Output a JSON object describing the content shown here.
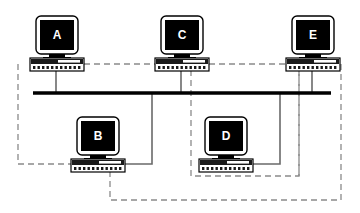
{
  "diagram": {
    "type": "network-topology",
    "canvas": {
      "width": 360,
      "height": 213
    },
    "colors": {
      "background": "#ffffff",
      "bus_line": "#000000",
      "solid_link": "#5a5a5a",
      "dashed_link": "#8a8a8a",
      "monitor_screen": "#000000",
      "monitor_bezel": "#ffffff",
      "monitor_outline": "#000000",
      "base_body": "#ffffff",
      "base_top_strip": "#1a1a1a",
      "label_text": "#ffffff"
    },
    "bus": {
      "name": "main-bus-cable",
      "x1": 33,
      "x2": 331,
      "y": 93,
      "thickness": 3.5
    },
    "nodes": [
      {
        "id": "A",
        "label": "A",
        "row": "top",
        "monitor": {
          "x": 36,
          "y": 16,
          "w": 42,
          "h": 38
        },
        "base": {
          "x": 30,
          "y": 57,
          "w": 54,
          "h": 13
        },
        "drop_x": 56,
        "drop_to_bus": true
      },
      {
        "id": "C",
        "label": "C",
        "row": "top",
        "monitor": {
          "x": 161,
          "y": 16,
          "w": 42,
          "h": 38
        },
        "base": {
          "x": 155,
          "y": 57,
          "w": 54,
          "h": 13
        },
        "drop_x": 181,
        "drop_to_bus": true
      },
      {
        "id": "E",
        "label": "E",
        "row": "top",
        "monitor": {
          "x": 292,
          "y": 16,
          "w": 42,
          "h": 38
        },
        "base": {
          "x": 286,
          "y": 57,
          "w": 54,
          "h": 13
        },
        "drop_x": 312,
        "drop_to_bus": true
      },
      {
        "id": "B",
        "label": "B",
        "row": "bottom",
        "monitor": {
          "x": 77,
          "y": 117,
          "w": 42,
          "h": 38
        },
        "base": {
          "x": 71,
          "y": 158,
          "w": 54,
          "h": 13
        },
        "drop_x": 97,
        "drop_to_bus": false
      },
      {
        "id": "D",
        "label": "D",
        "row": "bottom",
        "monitor": {
          "x": 205,
          "y": 117,
          "w": 42,
          "h": 38
        },
        "base": {
          "x": 199,
          "y": 158,
          "w": 54,
          "h": 13
        },
        "drop_x": 225,
        "drop_to_bus": false
      }
    ],
    "solid_links": [
      {
        "name": "link-a-to-bus",
        "points": "56,70 56,93"
      },
      {
        "name": "link-c-to-bus",
        "points": "181,70 181,93"
      },
      {
        "name": "link-e-to-bus",
        "points": "312,70 312,93"
      },
      {
        "name": "link-b-to-bus",
        "points": "125,164 152,164 152,93"
      },
      {
        "name": "link-d-to-bus",
        "points": "253,164 280,164 280,93"
      }
    ],
    "dashed_links": [
      {
        "name": "dashed-a-left-to-b",
        "points": "18,64 18,164 71,164"
      },
      {
        "name": "dashed-a-right-to-c",
        "points": "84,64 155,64"
      },
      {
        "name": "dashed-c-right-to-e",
        "points": "209,64 286,64"
      },
      {
        "name": "dashed-c-down-to-d",
        "points": "191,70 191,176 225,176"
      },
      {
        "name": "dashed-b-down-to-bottom",
        "points": "110,171 110,200 341,200 341,64 340,64"
      },
      {
        "name": "dashed-d-down-right",
        "points": "225,176 299,176 299,64"
      },
      {
        "name": "dashed-e-left-drop",
        "points": "299,70 299,176"
      },
      {
        "name": "dashed-e-right-drop",
        "points": "341,64 341,200"
      }
    ],
    "dash_pattern": "6 4",
    "legend": {
      "solid_meaning": "physical bus connection",
      "dashed_meaning": "logical ring path"
    }
  }
}
